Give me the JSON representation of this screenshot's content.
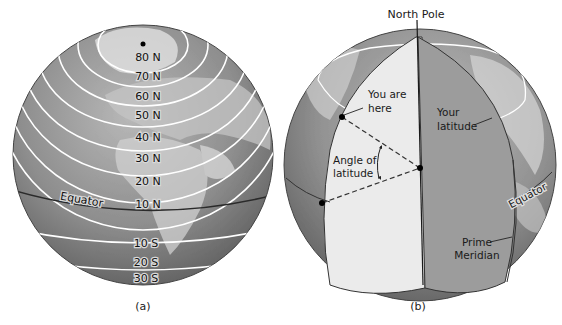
{
  "figure": {
    "panel_a": {
      "caption": "(a)",
      "latitude_labels": [
        "80 N",
        "70 N",
        "60 N",
        "50 N",
        "40 N",
        "30 N",
        "20 N",
        "10 N",
        "10 S",
        "20 S",
        "30 S"
      ],
      "equator_label": "Equator"
    },
    "panel_b": {
      "caption": "(b)",
      "north_pole_label": "North Pole",
      "you_are_here_label": [
        "You are",
        "here"
      ],
      "your_latitude_label": [
        "Your",
        "latitude"
      ],
      "angle_label": [
        "Angle of",
        "latitude"
      ],
      "equator_label": "Equator",
      "prime_meridian_label": [
        "Prime",
        "Meridian"
      ]
    },
    "colors": {
      "ocean_gray": "#8a8a8a",
      "land_gray": "#c9c9c9",
      "cutaway_light": "#e9e9e9",
      "cutaway_dark": "#9a9a9a",
      "line_white": "#ffffff",
      "outline": "#333333"
    }
  }
}
